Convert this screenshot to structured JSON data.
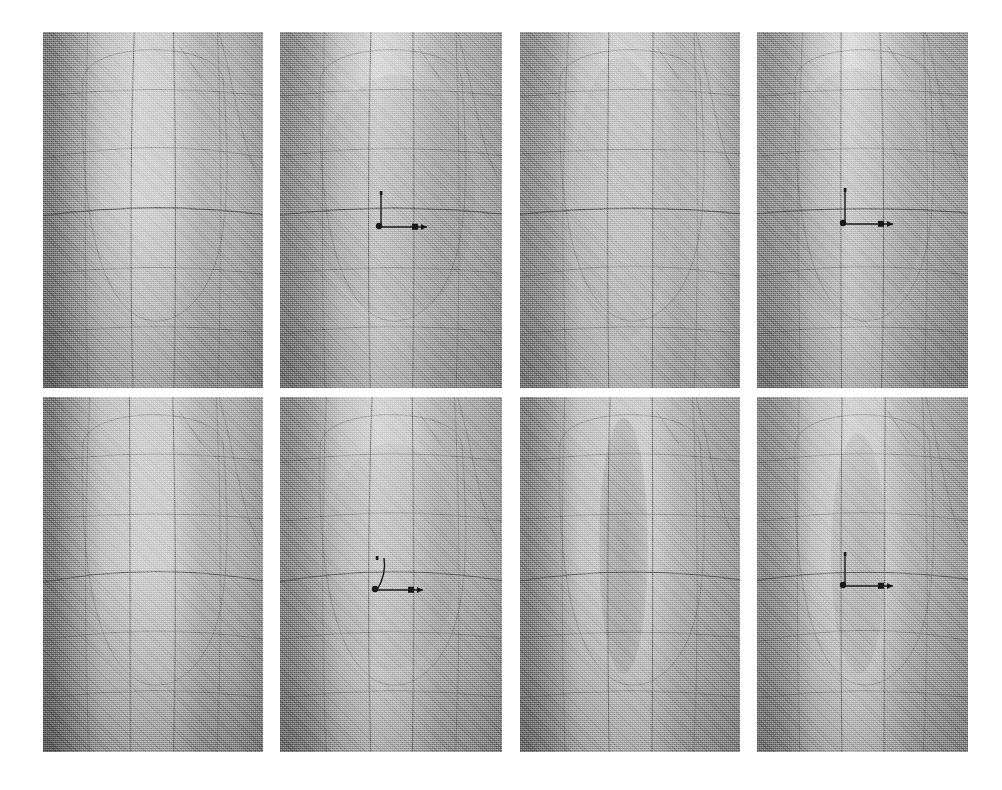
{
  "figure": {
    "background_color": "#ffffff",
    "width": 1002,
    "height": 790,
    "grid_rows": 2,
    "grid_cols": 4,
    "render_style": "grayscale halftone scanned print",
    "surface_color_light": "#dcdcdc",
    "surface_color_mid": "#b6b6b6",
    "surface_color_dark": "#878787",
    "mesh_line_color": "#4a4a4a",
    "triad_color": "#191919"
  },
  "panels": [
    {
      "id": "panel-1",
      "label": "a",
      "row": 1,
      "col": 1,
      "x": 43,
      "y": 32,
      "w": 220,
      "h": 356,
      "has_triad": false,
      "triad": null,
      "shading": {
        "left_edge": "#7e7e7e",
        "center": "#d4d4d4",
        "right_edge": "#b0b0b0",
        "bottom_darkening": 0.22,
        "band_count": 6
      },
      "blob": {
        "present": false,
        "cx": 0.5,
        "cy": 0.5,
        "rx": 0.0,
        "ry": 0.0,
        "strength": 0.0
      }
    },
    {
      "id": "panel-2",
      "label": "b",
      "row": 1,
      "col": 2,
      "x": 280,
      "y": 32,
      "w": 222,
      "h": 356,
      "has_triad": true,
      "triad": {
        "x": 0.42,
        "y": 0.43,
        "style": "straight",
        "y_axis_len": 34,
        "x_axis_len": 46,
        "origin_dot": true,
        "x_tick": true
      },
      "shading": {
        "left_edge": "#8a8a8a",
        "center": "#dadada",
        "right_edge": "#a8a8a8",
        "bottom_darkening": 0.18,
        "band_count": 6
      },
      "blob": {
        "present": true,
        "cx": 0.52,
        "cy": 0.46,
        "rx": 0.36,
        "ry": 0.34,
        "strength": 0.1
      }
    },
    {
      "id": "panel-3",
      "label": "c",
      "row": 1,
      "col": 3,
      "x": 520,
      "y": 32,
      "w": 220,
      "h": 356,
      "has_triad": false,
      "triad": null,
      "shading": {
        "left_edge": "#8d8d8d",
        "center": "#d2d2d2",
        "right_edge": "#b8b8b8",
        "bottom_darkening": 0.16,
        "band_count": 6
      },
      "blob": {
        "present": true,
        "cx": 0.46,
        "cy": 0.47,
        "rx": 0.22,
        "ry": 0.4,
        "strength": 0.07
      }
    },
    {
      "id": "panel-4",
      "label": "d",
      "row": 1,
      "col": 4,
      "x": 757,
      "y": 32,
      "w": 211,
      "h": 356,
      "has_triad": true,
      "triad": {
        "x": 0.38,
        "y": 0.42,
        "style": "straight",
        "y_axis_len": 34,
        "x_axis_len": 48,
        "origin_dot": true,
        "x_tick": true
      },
      "shading": {
        "left_edge": "#8f8f8f",
        "center": "#dedede",
        "right_edge": "#a2a2a2",
        "bottom_darkening": 0.2,
        "band_count": 6
      },
      "blob": {
        "present": true,
        "cx": 0.46,
        "cy": 0.46,
        "rx": 0.34,
        "ry": 0.36,
        "strength": 0.09
      }
    },
    {
      "id": "panel-5",
      "label": "e",
      "row": 2,
      "col": 1,
      "x": 43,
      "y": 397,
      "w": 220,
      "h": 355,
      "has_triad": false,
      "triad": null,
      "shading": {
        "left_edge": "#7a7a7a",
        "center": "#cfcfcf",
        "right_edge": "#aeaeae",
        "bottom_darkening": 0.24,
        "band_count": 6
      },
      "blob": {
        "present": false,
        "cx": 0.5,
        "cy": 0.5,
        "rx": 0.0,
        "ry": 0.0,
        "strength": 0.0
      }
    },
    {
      "id": "panel-6",
      "label": "f",
      "row": 2,
      "col": 2,
      "x": 280,
      "y": 397,
      "w": 222,
      "h": 355,
      "has_triad": true,
      "triad": {
        "x": 0.4,
        "y": 0.43,
        "style": "curved",
        "y_axis_len": 32,
        "x_axis_len": 46,
        "origin_dot": true,
        "x_tick": true
      },
      "shading": {
        "left_edge": "#888888",
        "center": "#d6d6d6",
        "right_edge": "#aaaaaa",
        "bottom_darkening": 0.2,
        "band_count": 6
      },
      "blob": {
        "present": true,
        "cx": 0.5,
        "cy": 0.45,
        "rx": 0.3,
        "ry": 0.32,
        "strength": 0.07
      }
    },
    {
      "id": "panel-7",
      "label": "g",
      "row": 2,
      "col": 3,
      "x": 520,
      "y": 397,
      "w": 220,
      "h": 355,
      "has_triad": false,
      "triad": null,
      "shading": {
        "left_edge": "#848484",
        "center": "#cbcbcb",
        "right_edge": "#a5a5a5",
        "bottom_darkening": 0.18,
        "band_count": 6
      },
      "blob": {
        "present": true,
        "cx": 0.47,
        "cy": 0.42,
        "rx": 0.11,
        "ry": 0.36,
        "strength": 0.18
      }
    },
    {
      "id": "panel-8",
      "label": "h",
      "row": 2,
      "col": 4,
      "x": 757,
      "y": 397,
      "w": 211,
      "h": 355,
      "has_triad": true,
      "triad": {
        "x": 0.38,
        "y": 0.42,
        "style": "straight",
        "y_axis_len": 32,
        "x_axis_len": 48,
        "origin_dot": true,
        "x_tick": true
      },
      "shading": {
        "left_edge": "#8c8c8c",
        "center": "#d4d4d4",
        "right_edge": "#a6a6a6",
        "bottom_darkening": 0.18,
        "band_count": 6
      },
      "blob": {
        "present": true,
        "cx": 0.48,
        "cy": 0.44,
        "rx": 0.13,
        "ry": 0.34,
        "strength": 0.14
      }
    }
  ]
}
